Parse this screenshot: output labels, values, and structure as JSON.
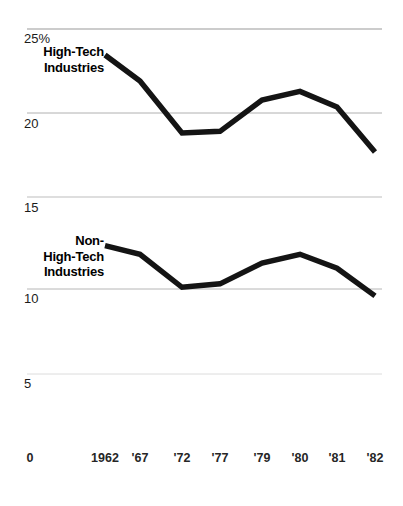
{
  "chart_data": {
    "type": "line",
    "title": "",
    "xlabel": "",
    "ylabel": "",
    "ylim": [
      0,
      25
    ],
    "xlim_labels": [
      "0",
      "1962",
      "'67",
      "'72",
      "'77",
      "'79",
      "'80",
      "'81",
      "'82"
    ],
    "grid": true,
    "legend_position": "inline-labels",
    "categories": [
      "1962",
      "'67",
      "'72",
      "'77",
      "'79",
      "'80",
      "'81",
      "'82"
    ],
    "y_ticks": [
      {
        "label": "25%",
        "value": 25
      },
      {
        "label": "20",
        "value": 20
      },
      {
        "label": "15",
        "value": 15
      },
      {
        "label": "10",
        "value": 10
      },
      {
        "label": "5",
        "value": 5
      },
      {
        "label": "0",
        "value": 0
      }
    ],
    "x_ticks": [
      {
        "label": "0",
        "x_px": 30
      },
      {
        "label": "1962",
        "x_px": 105
      },
      {
        "label": "'67",
        "x_px": 140
      },
      {
        "label": "'72",
        "x_px": 182
      },
      {
        "label": "'77",
        "x_px": 220
      },
      {
        "label": "'79",
        "x_px": 262
      },
      {
        "label": "'80",
        "x_px": 300
      },
      {
        "label": "'81",
        "x_px": 337
      },
      {
        "label": "'82",
        "x_px": 375
      }
    ],
    "series": [
      {
        "name": "High-Tech Industries",
        "label_lines": [
          "High-Tech",
          "Industries"
        ],
        "color": "#141414",
        "values": [
          23.5,
          22.0,
          19.0,
          19.1,
          20.9,
          21.4,
          20.5,
          17.9
        ]
      },
      {
        "name": "Non-High-Tech Industries",
        "label_lines": [
          "Non-",
          "High-Tech",
          "Industries"
        ],
        "color": "#141414",
        "values": [
          12.5,
          12.0,
          10.1,
          10.3,
          11.5,
          12.0,
          11.2,
          9.6
        ]
      }
    ]
  },
  "axis": {
    "gridline_color": "#b4b4b4",
    "unit_suffix": "%"
  }
}
